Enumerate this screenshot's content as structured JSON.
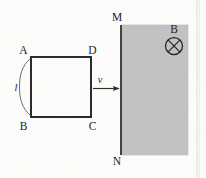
{
  "figure": {
    "kind": "physics-diagram",
    "canvas": {
      "width": 206,
      "height": 178
    },
    "background_color": "#fdfdfc",
    "ink_color": "#262626",
    "field_fill_color": "#c2c2c2",
    "field_edge_color": "#aaaaaa",
    "loop": {
      "name": "square-loop-ABCD",
      "stroke_color": "#1f1f1f",
      "stroke_width": 1.9,
      "x": 31,
      "y": 57,
      "width": 60,
      "height": 60,
      "corner_labels": {
        "top_left": "A",
        "top_right": "D",
        "bottom_right": "C",
        "bottom_left": "B"
      }
    },
    "side_brace": {
      "name": "length-brace",
      "label": "l",
      "label_style": "italic",
      "stroke_color": "#5a5a5a",
      "stroke_width": 0.9
    },
    "velocity_arrow": {
      "name": "velocity-arrow",
      "label": "v",
      "label_style": "italic",
      "stroke_color": "#2b2b2b",
      "from_x": 93,
      "to_x": 120,
      "y": 88
    },
    "field_region": {
      "name": "magnetic-field-region",
      "x": 122,
      "y": 25,
      "width": 66,
      "height": 130,
      "fill": "#c2c2c2"
    },
    "boundary_line": {
      "name": "boundary-line-MN",
      "top_label": "M",
      "bottom_label": "N",
      "x": 121,
      "y_top": 25,
      "y_bottom": 155,
      "stroke_color": "#1f1f1f",
      "stroke_width": 1.7
    },
    "field_symbol": {
      "name": "field-into-page-symbol",
      "label": "B",
      "glyph": "circle-cross",
      "cx": 174,
      "cy": 46,
      "r": 8.5,
      "stroke_color": "#1f1f1f"
    },
    "page_rule": {
      "name": "page-column-rule",
      "x": 197,
      "color": "#d8d8d8"
    }
  }
}
